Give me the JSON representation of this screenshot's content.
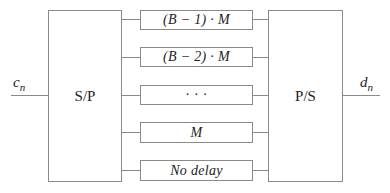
{
  "diagram": {
    "type": "block-diagram",
    "input_signal": {
      "symbol": "c",
      "subscript": "n"
    },
    "output_signal": {
      "symbol": "d",
      "subscript": "n"
    },
    "serial_to_parallel": {
      "label": "S/P"
    },
    "parallel_to_serial": {
      "label": "P/S"
    },
    "delay_branches": [
      {
        "label": "(B − 1) · M"
      },
      {
        "label": "(B − 2) · M"
      },
      {
        "label": "· · ·"
      },
      {
        "label": "M"
      },
      {
        "label": "No delay"
      }
    ],
    "line_color": "#8a8a8a",
    "text_color": "#222222"
  }
}
